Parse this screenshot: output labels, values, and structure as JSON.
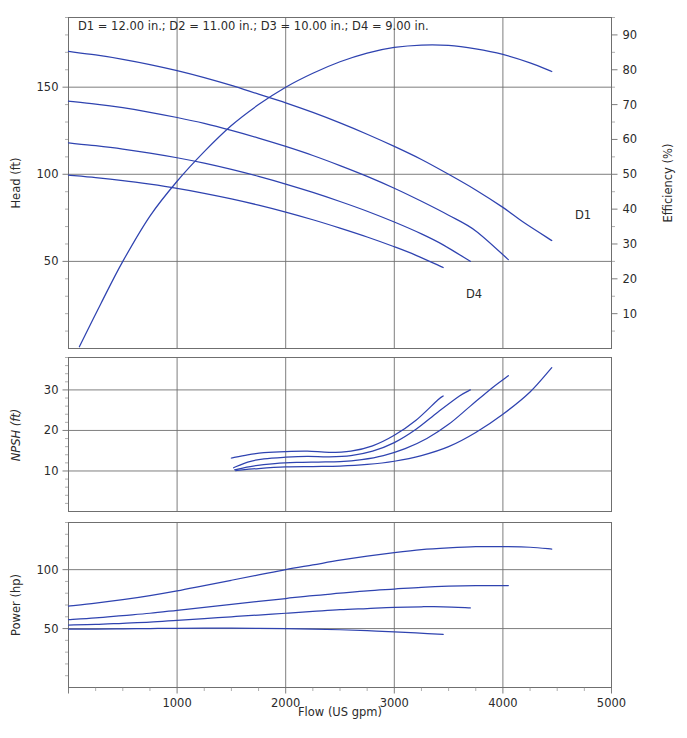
{
  "caption": "D1 = 12.00 in.; D2 = 11.00 in.; D3 = 10.00 in.; D4 = 9.00 in.",
  "annotations": {
    "d1": "D1",
    "d4": "D4"
  },
  "axes": {
    "x_title": "Flow (US gpm)",
    "x_ticks": [
      "1000",
      "2000",
      "3000",
      "4000",
      "5000"
    ],
    "head_title": "Head (ft)",
    "head_ticks": [
      "50",
      "100",
      "150"
    ],
    "eff_title": "Efficiency (%)",
    "eff_ticks": [
      "10",
      "20",
      "30",
      "40",
      "50",
      "60",
      "70",
      "80",
      "90"
    ],
    "npsh_title": "NPSH (ft)",
    "npsh_ticks": [
      "10",
      "20",
      "30"
    ],
    "power_title": "Power (hp)",
    "power_ticks": [
      "50",
      "100"
    ]
  },
  "colors": {
    "curve": "#2f43b0",
    "axis": "#6f6f6f",
    "text": "#2b2b2b"
  },
  "chart_data": {
    "type": "line",
    "xlabel": "Flow (US gpm)",
    "xlim": [
      0,
      5000
    ],
    "grid": true,
    "legend": "none",
    "panels": [
      {
        "name": "head-efficiency",
        "ylabel": "Head (ft)",
        "ylim": [
          0,
          190
        ],
        "y2label": "Efficiency (%)",
        "y2lim": [
          0,
          95
        ],
        "series": [
          {
            "name": "D1 head",
            "axis": "left",
            "x": [
              0,
              250,
              500,
              750,
              1000,
              1250,
              1500,
              1750,
              2000,
              2250,
              2500,
              2750,
              3000,
              3250,
              3500,
              3750,
              4000,
              4200,
              4450
            ],
            "y": [
              170.5,
              168.5,
              166.0,
              163.0,
              159.5,
              155.5,
              151.0,
              146.0,
              141.0,
              135.5,
              129.5,
              123.0,
              116.0,
              108.5,
              100.0,
              91.0,
              81.0,
              72.0,
              62.0
            ]
          },
          {
            "name": "D2 head",
            "axis": "left",
            "x": [
              0,
              250,
              500,
              750,
              1000,
              1250,
              1500,
              1750,
              2000,
              2250,
              2500,
              2750,
              3000,
              3250,
              3500,
              3750,
              4050
            ],
            "y": [
              142.0,
              140.3,
              138.2,
              135.6,
              132.6,
              129.2,
              125.2,
              120.8,
              116.0,
              110.8,
              105.0,
              98.8,
              92.0,
              84.5,
              76.5,
              67.5,
              51.0
            ]
          },
          {
            "name": "D3 head",
            "axis": "left",
            "x": [
              0,
              250,
              500,
              750,
              1000,
              1250,
              1500,
              1750,
              2000,
              2250,
              2500,
              2750,
              3000,
              3250,
              3450,
              3700
            ],
            "y": [
              118.0,
              116.4,
              114.5,
              112.2,
              109.5,
              106.4,
              102.8,
              98.8,
              94.4,
              89.6,
              84.4,
              78.8,
              72.6,
              65.8,
              59.5,
              50.0
            ]
          },
          {
            "name": "D4 head",
            "axis": "left",
            "x": [
              0,
              250,
              500,
              750,
              1000,
              1250,
              1500,
              1750,
              2000,
              2250,
              2500,
              2750,
              3000,
              3200,
              3450
            ],
            "y": [
              99.5,
              98.1,
              96.4,
              94.3,
              91.9,
              89.1,
              85.9,
              82.3,
              78.3,
              73.9,
              69.1,
              64.0,
              58.4,
              53.5,
              46.5
            ]
          },
          {
            "name": "Efficiency",
            "axis": "right",
            "x": [
              100,
              300,
              500,
              750,
              1000,
              1250,
              1500,
              1750,
              2000,
              2250,
              2500,
              2750,
              3000,
              3250,
              3500,
              3750,
              4000,
              4250,
              4450
            ],
            "y": [
              0.5,
              13.0,
              25.0,
              38.0,
              48.0,
              56.5,
              64.0,
              70.0,
              75.0,
              79.0,
              82.3,
              84.8,
              86.4,
              87.1,
              87.0,
              86.0,
              84.4,
              82.0,
              79.5
            ]
          }
        ]
      },
      {
        "name": "npsh",
        "ylabel": "NPSH (ft)",
        "ylim": [
          0,
          38
        ],
        "series": [
          {
            "name": "NPSH D4",
            "x": [
              1500,
              1650,
              1800,
              2000,
              2200,
              2400,
              2600,
              2800,
              3000,
              3200,
              3400,
              3450
            ],
            "y": [
              13.2,
              14.0,
              14.5,
              14.8,
              14.9,
              14.6,
              14.9,
              16.2,
              18.8,
              22.5,
              27.5,
              28.5
            ]
          },
          {
            "name": "NPSH D3",
            "x": [
              1520,
              1650,
              1800,
              2000,
              2200,
              2400,
              2600,
              2800,
              3000,
              3200,
              3400,
              3600,
              3700
            ],
            "y": [
              10.8,
              12.2,
              13.0,
              13.4,
              13.6,
              13.5,
              13.8,
              14.9,
              17.0,
              20.3,
              24.5,
              28.5,
              30.0
            ]
          },
          {
            "name": "NPSH D2",
            "x": [
              1530,
              1700,
              1900,
              2100,
              2300,
              2500,
              2700,
              2900,
              3100,
              3300,
              3500,
              3700,
              3900,
              4050
            ],
            "y": [
              10.3,
              11.2,
              11.8,
              12.1,
              12.2,
              12.3,
              12.8,
              13.8,
              15.5,
              18.0,
              21.5,
              26.0,
              30.5,
              33.5
            ]
          },
          {
            "name": "NPSH D1",
            "x": [
              1540,
              1750,
              2000,
              2250,
              2500,
              2750,
              3000,
              3250,
              3500,
              3750,
              4000,
              4250,
              4450
            ],
            "y": [
              10.1,
              10.6,
              11.0,
              11.1,
              11.2,
              11.6,
              12.4,
              13.8,
              16.0,
              19.5,
              24.0,
              29.5,
              35.5
            ]
          }
        ]
      },
      {
        "name": "power",
        "ylabel": "Power (hp)",
        "ylim": [
          0,
          140
        ],
        "series": [
          {
            "name": "Power D1",
            "x": [
              0,
              250,
              500,
              750,
              1000,
              1250,
              1500,
              1750,
              2000,
              2250,
              2500,
              2750,
              3000,
              3250,
              3500,
              3750,
              4000,
              4250,
              4450
            ],
            "y": [
              69.0,
              71.5,
              74.5,
              78.0,
              82.0,
              86.5,
              91.0,
              95.5,
              100.0,
              104.0,
              108.0,
              111.5,
              114.5,
              117.0,
              118.5,
              119.5,
              119.5,
              119.0,
              117.5
            ]
          },
          {
            "name": "Power D2",
            "x": [
              0,
              250,
              500,
              750,
              1000,
              1250,
              1500,
              1750,
              2000,
              2250,
              2500,
              2750,
              3000,
              3250,
              3500,
              3750,
              4050
            ],
            "y": [
              57.5,
              59.0,
              61.0,
              63.0,
              65.5,
              68.0,
              70.5,
              73.0,
              75.5,
              78.0,
              80.0,
              82.0,
              83.5,
              85.0,
              86.0,
              86.5,
              86.5
            ]
          },
          {
            "name": "Power D3",
            "x": [
              0,
              250,
              500,
              750,
              1000,
              1250,
              1500,
              1750,
              2000,
              2250,
              2500,
              2750,
              3000,
              3250,
              3450,
              3700
            ],
            "y": [
              53.0,
              53.5,
              54.5,
              55.5,
              57.0,
              58.5,
              60.0,
              61.5,
              63.0,
              64.5,
              66.0,
              67.0,
              68.0,
              68.5,
              68.5,
              67.5
            ]
          },
          {
            "name": "Power D4",
            "x": [
              0,
              250,
              500,
              750,
              1000,
              1250,
              1500,
              1750,
              2000,
              2250,
              2500,
              2750,
              3000,
              3200,
              3450
            ],
            "y": [
              49.5,
              49.6,
              49.8,
              50.0,
              50.2,
              50.3,
              50.3,
              50.2,
              50.0,
              49.6,
              49.0,
              48.2,
              47.2,
              46.3,
              45.0
            ]
          }
        ]
      }
    ]
  }
}
